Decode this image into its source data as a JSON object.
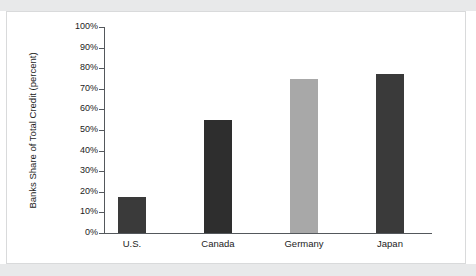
{
  "chart_data": {
    "type": "bar",
    "title": "",
    "subtitle": "",
    "xlabel": "",
    "ylabel": "Banks Share of Total Credit (percent)",
    "categories": [
      "U.S.",
      "Canada",
      "Germany",
      "Japan"
    ],
    "values": [
      17.5,
      55,
      75,
      77
    ],
    "value_labels": [
      "",
      "",
      "",
      ""
    ],
    "bar_colors": [
      "#3a3a3a",
      "#2e2e2e",
      "#a8a8a8",
      "#3a3a3a"
    ],
    "ylim": [
      0,
      100
    ],
    "ytick_labels": [
      "100%",
      "90%",
      "80%",
      "70%",
      "60%",
      "50%",
      "40%",
      "30%",
      "20%",
      "10%",
      "0%"
    ],
    "ytick_values": [
      100,
      90,
      80,
      70,
      60,
      50,
      40,
      30,
      20,
      10,
      0
    ],
    "grid": false,
    "legend": false,
    "legend_position": "none",
    "axis_color": "#54585c",
    "background_color": "#ffffff",
    "panel_border_color": "#d9dadb",
    "band_color": "#e8e9ea"
  }
}
